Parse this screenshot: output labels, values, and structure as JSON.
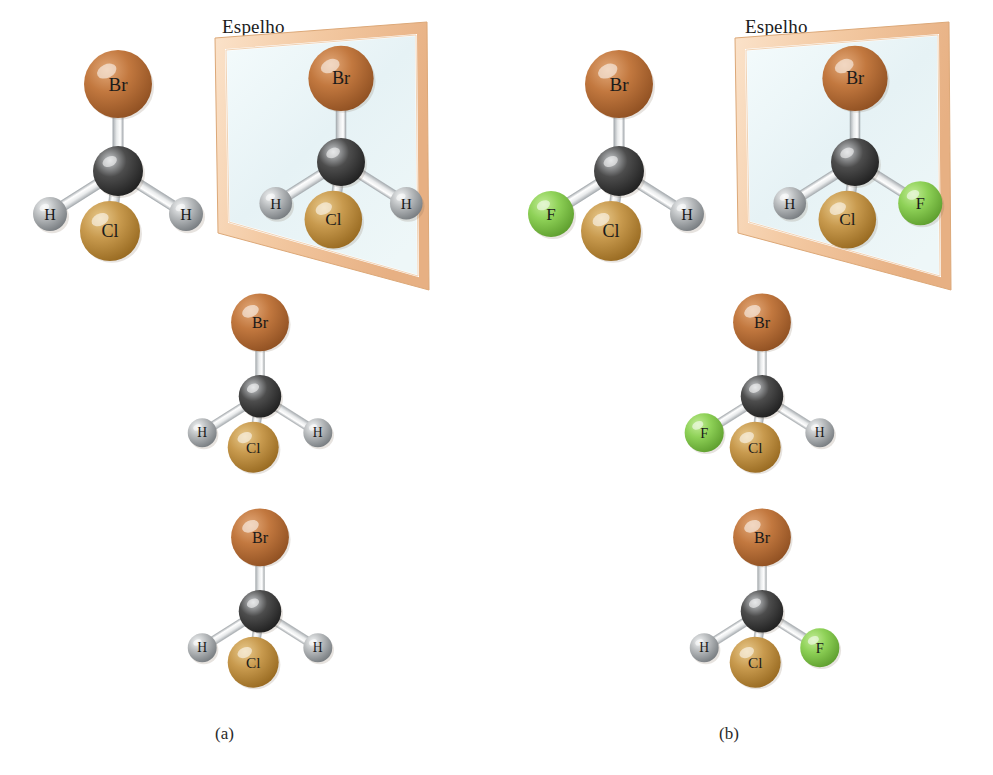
{
  "figure": {
    "title_text": "",
    "mirror_label": "Espelho",
    "captions": {
      "a": "(a)",
      "b": "(b)"
    }
  },
  "colors": {
    "background": "#ffffff",
    "bromine": "#c2783f",
    "bromine_light": "#e2a878",
    "bromine_dark": "#8e4f21",
    "chlorine": "#c89a4e",
    "chlorine_light": "#e8c98c",
    "chlorine_dark": "#96681f",
    "fluorine": "#8ed157",
    "fluorine_light": "#c2ec96",
    "fluorine_dark": "#5c9c2c",
    "hydrogen": "#b9bcbe",
    "hydrogen_light": "#f2f4f5",
    "hydrogen_dark": "#74797d",
    "carbon": "#4d4d4d",
    "carbon_light": "#c9cccf",
    "carbon_dark": "#1e1e1e",
    "bond": "#e9ebec",
    "bond_shade": "#a8adb1",
    "mirror_frame": "#f3c9a2",
    "mirror_frame_light": "#fbe3cb",
    "mirror_frame_dark": "#d79d66",
    "mirror_glass": "#e9f4f6",
    "label_text": "#1a1a1a"
  },
  "atom_labels": {
    "bromine": "Br",
    "chlorine": "Cl",
    "fluorine": "F",
    "hydrogen": "H",
    "carbon": ""
  },
  "panels": [
    {
      "id": "a",
      "caption": "(a)",
      "molecule_name": "CH2BrCl",
      "achiral": true,
      "rows": [
        {
          "row": "top-original",
          "atoms": [
            {
              "element": "Br",
              "label": "Br",
              "position": "top"
            },
            {
              "element": "C",
              "label": "",
              "position": "center"
            },
            {
              "element": "H",
              "label": "H",
              "position": "left"
            },
            {
              "element": "H",
              "label": "H",
              "position": "right"
            },
            {
              "element": "Cl",
              "label": "Cl",
              "position": "front-bottom"
            }
          ]
        },
        {
          "row": "top-reflection",
          "in_mirror": true,
          "atoms": [
            {
              "element": "Br",
              "label": "Br",
              "position": "top"
            },
            {
              "element": "C",
              "label": "",
              "position": "center"
            },
            {
              "element": "H",
              "label": "H",
              "position": "left"
            },
            {
              "element": "H",
              "label": "H",
              "position": "right"
            },
            {
              "element": "Cl",
              "label": "Cl",
              "position": "front-bottom"
            }
          ]
        },
        {
          "row": "middle",
          "atoms": [
            {
              "element": "Br",
              "label": "Br",
              "position": "top"
            },
            {
              "element": "C",
              "label": "",
              "position": "center"
            },
            {
              "element": "H",
              "label": "H",
              "position": "left"
            },
            {
              "element": "H",
              "label": "H",
              "position": "right"
            },
            {
              "element": "Cl",
              "label": "Cl",
              "position": "front-bottom"
            }
          ]
        },
        {
          "row": "bottom",
          "atoms": [
            {
              "element": "Br",
              "label": "Br",
              "position": "top"
            },
            {
              "element": "C",
              "label": "",
              "position": "center"
            },
            {
              "element": "H",
              "label": "H",
              "position": "left"
            },
            {
              "element": "H",
              "label": "H",
              "position": "right"
            },
            {
              "element": "Cl",
              "label": "Cl",
              "position": "front-bottom"
            }
          ]
        }
      ]
    },
    {
      "id": "b",
      "caption": "(b)",
      "molecule_name": "CHBrClF",
      "achiral": false,
      "rows": [
        {
          "row": "top-original",
          "atoms": [
            {
              "element": "Br",
              "label": "Br",
              "position": "top"
            },
            {
              "element": "C",
              "label": "",
              "position": "center"
            },
            {
              "element": "F",
              "label": "F",
              "position": "left"
            },
            {
              "element": "H",
              "label": "H",
              "position": "right"
            },
            {
              "element": "Cl",
              "label": "Cl",
              "position": "front-bottom"
            }
          ]
        },
        {
          "row": "top-reflection",
          "in_mirror": true,
          "atoms": [
            {
              "element": "Br",
              "label": "Br",
              "position": "top"
            },
            {
              "element": "C",
              "label": "",
              "position": "center"
            },
            {
              "element": "H",
              "label": "H",
              "position": "left"
            },
            {
              "element": "F",
              "label": "F",
              "position": "right"
            },
            {
              "element": "Cl",
              "label": "Cl",
              "position": "front-bottom"
            }
          ]
        },
        {
          "row": "middle",
          "atoms": [
            {
              "element": "Br",
              "label": "Br",
              "position": "top"
            },
            {
              "element": "C",
              "label": "",
              "position": "center"
            },
            {
              "element": "F",
              "label": "F",
              "position": "left"
            },
            {
              "element": "H",
              "label": "H",
              "position": "right"
            },
            {
              "element": "Cl",
              "label": "Cl",
              "position": "front-bottom"
            }
          ]
        },
        {
          "row": "bottom",
          "atoms": [
            {
              "element": "Br",
              "label": "Br",
              "position": "top"
            },
            {
              "element": "C",
              "label": "",
              "position": "center"
            },
            {
              "element": "H",
              "label": "H",
              "position": "left"
            },
            {
              "element": "F",
              "label": "F",
              "position": "right"
            },
            {
              "element": "Cl",
              "label": "Cl",
              "position": "front-bottom"
            }
          ]
        }
      ]
    }
  ]
}
